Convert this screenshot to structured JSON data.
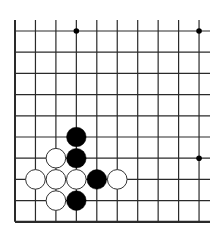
{
  "board": {
    "type": "go-board-partial",
    "visible_columns": 10,
    "visible_rows": 10,
    "open_edges": [
      "top",
      "right"
    ],
    "closed_edges": [
      "left",
      "bottom"
    ],
    "colors": {
      "background": "#ffffff",
      "line": "#2a2a2a",
      "black_stone": "#000000",
      "white_stone": "#ffffff",
      "white_stone_border": "#333333"
    },
    "star_points": [
      {
        "col": 3,
        "row": 0
      },
      {
        "col": 9,
        "row": 0
      },
      {
        "col": 9,
        "row": 6
      }
    ],
    "stones": [
      {
        "color": "black",
        "col": 3,
        "row": 5
      },
      {
        "color": "black",
        "col": 3,
        "row": 6
      },
      {
        "color": "white",
        "col": 2,
        "row": 6
      },
      {
        "color": "white",
        "col": 1,
        "row": 7
      },
      {
        "color": "white",
        "col": 2,
        "row": 7
      },
      {
        "color": "white",
        "col": 3,
        "row": 7
      },
      {
        "color": "black",
        "col": 4,
        "row": 7
      },
      {
        "color": "white",
        "col": 5,
        "row": 7
      },
      {
        "color": "white",
        "col": 2,
        "row": 8
      },
      {
        "color": "black",
        "col": 3,
        "row": 8
      }
    ]
  }
}
